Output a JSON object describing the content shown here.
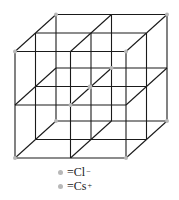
{
  "figure": {
    "type": "crystal-lattice",
    "line_color": "#1a1a1a",
    "ion_color": "#b8b8b8"
  },
  "lattice": {
    "front_x": [
      15,
      70.5,
      126
    ],
    "front_y": [
      51.5,
      105,
      158
    ],
    "depth_dx": 41,
    "depth_dy": -37,
    "cl_ions": [
      [
        15,
        51.5
      ],
      [
        126,
        51.5
      ],
      [
        15,
        158
      ],
      [
        126,
        158
      ],
      [
        56,
        14.5
      ],
      [
        167,
        14.5
      ],
      [
        56,
        121
      ],
      [
        167,
        121
      ],
      [
        70.5,
        105
      ],
      [
        111.5,
        68
      ]
    ],
    "cs_ion": [
      90,
      87
    ]
  },
  "legend": [
    {
      "symbol": "Cl",
      "charge": "−",
      "prefix": "= "
    },
    {
      "symbol": "Cs",
      "charge": "+",
      "prefix": "= "
    }
  ]
}
